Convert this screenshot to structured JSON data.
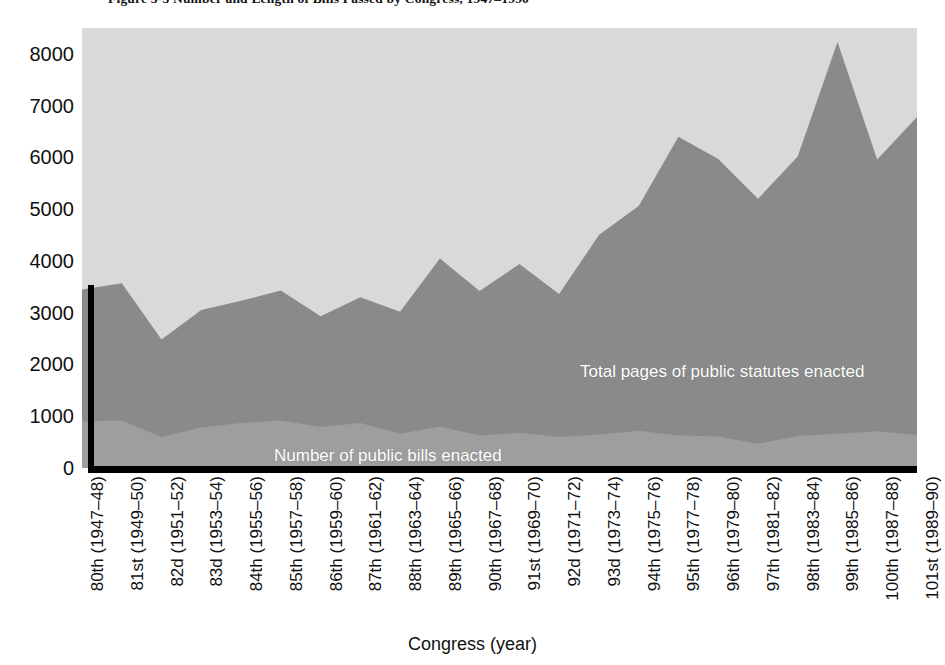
{
  "figure": {
    "caption": "Figure 3-3   Number and Length of Bills Passed by Congress, 1947–1990"
  },
  "chart_data": {
    "type": "area",
    "title": "Figure 3-3   Number and Length of Bills Passed by Congress, 1947–1990",
    "xlabel": "Congress (year)",
    "ylabel": "",
    "ylim": [
      0,
      8500
    ],
    "yticks": [
      0,
      1000,
      2000,
      3000,
      4000,
      5000,
      6000,
      7000,
      8000
    ],
    "ytick_labels": [
      "0",
      "1000",
      "2000",
      "3000",
      "4000",
      "5000",
      "6000",
      "7000",
      "8000"
    ],
    "grid": false,
    "legend_position": "inside-annotations",
    "stacked": false,
    "categories": [
      "80th (1947–48)",
      "81st (1949–50)",
      "82d (1951–52)",
      "83d (1953–54)",
      "84th (1955–56)",
      "85th (1957–58)",
      "86th (1959–60)",
      "87th (1961–62)",
      "88th (1963–64)",
      "89th (1965–66)",
      "90th (1967–68)",
      "91st (1969–70)",
      "92d (1971–72)",
      "93d (1973–74)",
      "94th (1975–76)",
      "95th (1977–78)",
      "96th (1979–80)",
      "97th (1981–82)",
      "98th (1983–84)",
      "99th (1985–86)",
      "100th (1987–88)",
      "101st (1989–90)"
    ],
    "series": [
      {
        "name": "Total pages of public statutes enacted",
        "color": "#8a8a8a",
        "values": [
          3450,
          3570,
          2480,
          3050,
          3230,
          3430,
          2930,
          3300,
          3020,
          4050,
          3420,
          3940,
          3360,
          4500,
          5060,
          6400,
          5970,
          5200,
          6020,
          8230,
          5960,
          6780
        ]
      },
      {
        "name": "Number of public bills enacted",
        "color": "#9e9e9e",
        "values": [
          900,
          920,
          600,
          780,
          870,
          920,
          790,
          870,
          660,
          800,
          630,
          680,
          600,
          650,
          720,
          630,
          610,
          470,
          620,
          660,
          710,
          640
        ]
      }
    ],
    "background_color": "#d9d9d9",
    "annotations": [
      {
        "text": "Total pages of public statutes enacted",
        "color": "#ffffff"
      },
      {
        "text": "Number of public bills enacted",
        "color": "#ffffff"
      }
    ]
  },
  "axes": {
    "x_title": "Congress (year)"
  }
}
